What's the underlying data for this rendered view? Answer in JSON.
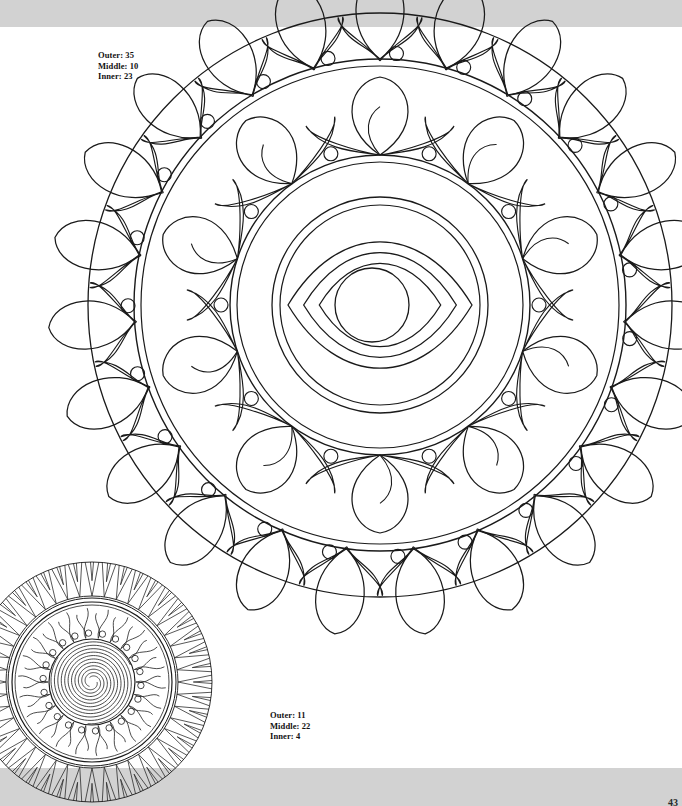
{
  "page": {
    "number": "43",
    "background_color": "#ffffff",
    "band_color": "#d2d2d2",
    "ink_color": "#1a1a1a"
  },
  "main_mandala": {
    "name": "eye-lotus-mandala",
    "center_x": 380,
    "center_y": 305,
    "outer_radius": 292,
    "label": {
      "outer_text": "Outer: 35",
      "middle_text": "Middle: 10",
      "inner_text": "Inner: 23",
      "outer_count": 35,
      "middle_count": 10,
      "inner_count": 23
    },
    "rings": {
      "outer_petal_count": 23,
      "outer_petal_ring_radius": 246,
      "outer_petal_length": 86,
      "middle_petal_count": 10,
      "middle_ring_radius": 150,
      "middle_ring_radius_inner": 143,
      "middle_petal_length": 78,
      "inner_ring_radius": 108,
      "inner_ring_radius_inner": 100,
      "dot_radius": 7
    },
    "eye": {
      "half_width": 92,
      "half_height": 52,
      "layers": 3,
      "iris_radius": 37,
      "iris_offset_x": -8
    }
  },
  "small_mandala": {
    "name": "spiral-sun-mandala",
    "center_x": 118,
    "center_y": 663,
    "outer_radius": 122,
    "label": {
      "outer_text": "Outer: 11",
      "middle_text": "Middle: 22",
      "inner_text": "Inner: 4",
      "outer_count": 11,
      "middle_count": 22,
      "inner_count": 4
    },
    "rings": {
      "spike_count": 44,
      "spike_outer_radius": 120,
      "spike_inner_radius": 86,
      "band_radius_a": 84,
      "band_radius_b": 80,
      "band_radius_c": 77,
      "flame_count": 22,
      "flame_outer_radius": 74,
      "flame_inner_radius": 44,
      "core_radius": 43,
      "spiral_arms": 3,
      "spiral_turns": 3.6
    }
  }
}
